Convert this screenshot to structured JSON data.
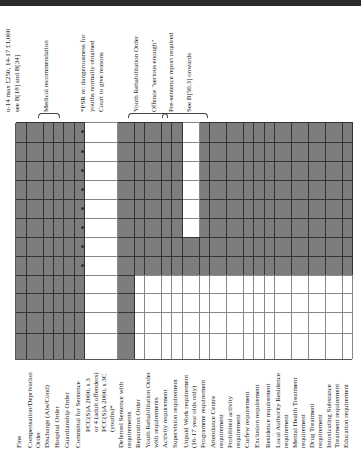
{
  "header": {
    "bar": "dark header strip"
  },
  "table": {
    "rows": [
      {
        "label": "Fine",
        "top": 0,
        "h": 11,
        "indent": false
      },
      {
        "label": "Compensation/Deprivation",
        "top": 11,
        "h": 8,
        "indent": false
      },
      {
        "label": "Order",
        "top": 19,
        "h": 8,
        "indent": false
      },
      {
        "label": "Discharge (Abs/Cond)",
        "top": 28,
        "h": 10,
        "indent": false
      },
      {
        "label": "Hospital Order",
        "top": 38,
        "h": 10,
        "indent": false
      },
      {
        "label": "Guardianship Order",
        "top": 48,
        "h": 11,
        "indent": false
      },
      {
        "label": "Committal for Sentence",
        "top": 59,
        "h": 10,
        "indent": false
      },
      {
        "label": "PCC(S)A 2000, s 3",
        "top": 69,
        "h": 8,
        "indent": true
      },
      {
        "label": "or 4 (adult offenders)",
        "top": 77,
        "h": 8,
        "indent": true
      },
      {
        "label": "PCC(S)A 2000, s 3C",
        "top": 85,
        "h": 8,
        "indent": true
      },
      {
        "label": "(youths)*",
        "top": 93,
        "h": 8,
        "indent": true
      },
      {
        "label": "Deferred Sentence with",
        "top": 102,
        "h": 8,
        "indent": false
      },
      {
        "label": "requirements",
        "top": 110,
        "h": 8,
        "indent": false
      },
      {
        "label": "Reparation Order",
        "top": 119,
        "h": 10,
        "indent": false
      },
      {
        "label": "Youth Rehabilitation Order",
        "top": 129,
        "h": 8,
        "indent": false
      },
      {
        "label": "with requirements",
        "top": 137,
        "h": 8,
        "indent": false
      },
      {
        "label": "Activity requirement",
        "top": 146,
        "h": 10,
        "indent": false
      },
      {
        "label": "Supervision requirement",
        "top": 156,
        "h": 11,
        "indent": false
      },
      {
        "label": "Unpaid Work requirement",
        "top": 167,
        "h": 8,
        "indent": false
      },
      {
        "label": "(16-17 year olds only)",
        "top": 175,
        "h": 8,
        "indent": false
      },
      {
        "label": "Programme requirement",
        "top": 184,
        "h": 10,
        "indent": false
      },
      {
        "label": "Attendance Centre",
        "top": 194,
        "h": 8,
        "indent": false
      },
      {
        "label": "requirement",
        "top": 202,
        "h": 8,
        "indent": false
      },
      {
        "label": "Prohibited activity",
        "top": 211,
        "h": 8,
        "indent": false
      },
      {
        "label": "requirement",
        "top": 219,
        "h": 8,
        "indent": false
      },
      {
        "label": "Curfew requirement",
        "top": 228,
        "h": 10,
        "indent": false
      },
      {
        "label": "Exclusion requirement",
        "top": 238,
        "h": 10,
        "indent": false
      },
      {
        "label": "Residence requirement",
        "top": 249,
        "h": 10,
        "indent": false
      },
      {
        "label": "Local Authority Residence",
        "top": 259,
        "h": 8,
        "indent": false
      },
      {
        "label": "requirement",
        "top": 267,
        "h": 8,
        "indent": false
      },
      {
        "label": "Mental Health Treatment",
        "top": 276,
        "h": 8,
        "indent": false
      },
      {
        "label": "requirement",
        "top": 284,
        "h": 8,
        "indent": false
      },
      {
        "label": "Drug Treatment",
        "top": 293,
        "h": 8,
        "indent": false
      },
      {
        "label": "requirement",
        "top": 301,
        "h": 8,
        "indent": false
      },
      {
        "label": "Intoxicating Substance",
        "top": 310,
        "h": 8,
        "indent": false
      },
      {
        "label": "Treatment requirement",
        "top": 318,
        "h": 8,
        "indent": false
      },
      {
        "label": "Education requirement",
        "top": 327,
        "h": 10,
        "indent": false
      }
    ]
  },
  "notes": [
    {
      "text": "u-14 max £250, 14-17 £1,000",
      "top": 4
    },
    {
      "text": "see B[18] and B[34]",
      "top": 13
    },
    {
      "text": "Medical recommendation",
      "top": 42
    },
    {
      "text": "*PSR re: dangerousness for",
      "top": 79
    },
    {
      "text": "youths normally obtained",
      "top": 88
    },
    {
      "text": "Court to give reasons",
      "top": 97
    },
    {
      "text": "Youth Rehabilitation Order",
      "top": 132
    },
    {
      "text": "Offence \"serious enough\"",
      "top": 150
    },
    {
      "text": "Pre-sentence report required",
      "top": 167
    },
    {
      "text": "See B[50.3] onwards",
      "top": 185
    }
  ],
  "legend": {
    "shaded": "#7d7d7d",
    "unshaded": "#ffffff",
    "dot_marker": "•"
  }
}
